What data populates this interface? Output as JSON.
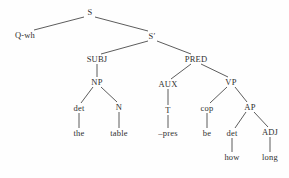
{
  "figure": {
    "type": "syntax-tree",
    "title": "",
    "background_color": "#fefefe",
    "line_color": "#4a4a4a",
    "text_color": "#2f2f2f"
  },
  "nodes": [
    {
      "id": "s",
      "label": "S",
      "kind": "category",
      "x": 90,
      "y": 12
    },
    {
      "id": "qwh",
      "label": "Q-wh",
      "kind": "category",
      "x": 25,
      "y": 35
    },
    {
      "id": "sbar",
      "label": "S′",
      "kind": "category",
      "x": 152,
      "y": 36
    },
    {
      "id": "subj",
      "label": "SUBJ",
      "kind": "category",
      "x": 97,
      "y": 59
    },
    {
      "id": "pred",
      "label": "PRED",
      "kind": "category",
      "x": 196,
      "y": 59
    },
    {
      "id": "np",
      "label": "NP",
      "kind": "category",
      "x": 97,
      "y": 82
    },
    {
      "id": "aux",
      "label": "AUX",
      "kind": "category",
      "x": 168,
      "y": 84
    },
    {
      "id": "vp",
      "label": "VP",
      "kind": "category",
      "x": 231,
      "y": 82
    },
    {
      "id": "det1",
      "label": "det",
      "kind": "category",
      "x": 79,
      "y": 108
    },
    {
      "id": "n",
      "label": "N",
      "kind": "category",
      "x": 119,
      "y": 107
    },
    {
      "id": "t",
      "label": "T",
      "kind": "category",
      "x": 168,
      "y": 110
    },
    {
      "id": "cop",
      "label": "cop",
      "kind": "category",
      "x": 207,
      "y": 108
    },
    {
      "id": "ap",
      "label": "AP",
      "kind": "category",
      "x": 250,
      "y": 107
    },
    {
      "id": "the",
      "label": "the",
      "kind": "terminal",
      "x": 79,
      "y": 133
    },
    {
      "id": "table",
      "label": "table",
      "kind": "terminal",
      "x": 119,
      "y": 133
    },
    {
      "id": "pres",
      "label": "–pres",
      "kind": "terminal",
      "x": 168,
      "y": 133
    },
    {
      "id": "be",
      "label": "be",
      "kind": "terminal",
      "x": 207,
      "y": 133
    },
    {
      "id": "det2",
      "label": "det",
      "kind": "category",
      "x": 232,
      "y": 133
    },
    {
      "id": "adj",
      "label": "ADJ",
      "kind": "category",
      "x": 270,
      "y": 132
    },
    {
      "id": "how",
      "label": "how",
      "kind": "terminal",
      "x": 232,
      "y": 157
    },
    {
      "id": "long",
      "label": "long",
      "kind": "terminal",
      "x": 270,
      "y": 157
    }
  ],
  "edges": [
    {
      "from": "s",
      "to": "qwh",
      "x1": 84,
      "y1": 17,
      "x2": 34,
      "y2": 30
    },
    {
      "from": "s",
      "to": "sbar",
      "x1": 95,
      "y1": 17,
      "x2": 148,
      "y2": 31
    },
    {
      "from": "sbar",
      "to": "subj",
      "x1": 148,
      "y1": 41,
      "x2": 101,
      "y2": 54
    },
    {
      "from": "sbar",
      "to": "pred",
      "x1": 157,
      "y1": 41,
      "x2": 191,
      "y2": 54
    },
    {
      "from": "subj",
      "to": "np",
      "x1": 97,
      "y1": 64,
      "x2": 97,
      "y2": 77
    },
    {
      "from": "pred",
      "to": "aux",
      "x1": 191,
      "y1": 64,
      "x2": 171,
      "y2": 79
    },
    {
      "from": "pred",
      "to": "vp",
      "x1": 201,
      "y1": 64,
      "x2": 228,
      "y2": 77
    },
    {
      "from": "np",
      "to": "det1",
      "x1": 93,
      "y1": 87,
      "x2": 81,
      "y2": 103
    },
    {
      "from": "np",
      "to": "n",
      "x1": 101,
      "y1": 87,
      "x2": 117,
      "y2": 102
    },
    {
      "from": "aux",
      "to": "t",
      "x1": 168,
      "y1": 89,
      "x2": 168,
      "y2": 105
    },
    {
      "from": "vp",
      "to": "cop",
      "x1": 227,
      "y1": 87,
      "x2": 210,
      "y2": 103
    },
    {
      "from": "vp",
      "to": "ap",
      "x1": 235,
      "y1": 87,
      "x2": 247,
      "y2": 102
    },
    {
      "from": "det1",
      "to": "the",
      "x1": 79,
      "y1": 113,
      "x2": 79,
      "y2": 128
    },
    {
      "from": "n",
      "to": "table",
      "x1": 119,
      "y1": 112,
      "x2": 119,
      "y2": 128
    },
    {
      "from": "t",
      "to": "pres",
      "x1": 168,
      "y1": 115,
      "x2": 168,
      "y2": 128
    },
    {
      "from": "cop",
      "to": "be",
      "x1": 207,
      "y1": 113,
      "x2": 207,
      "y2": 128
    },
    {
      "from": "ap",
      "to": "det2",
      "x1": 246,
      "y1": 112,
      "x2": 235,
      "y2": 128
    },
    {
      "from": "ap",
      "to": "adj",
      "x1": 254,
      "y1": 112,
      "x2": 268,
      "y2": 127
    },
    {
      "from": "det2",
      "to": "how",
      "x1": 232,
      "y1": 138,
      "x2": 232,
      "y2": 152
    },
    {
      "from": "adj",
      "to": "long",
      "x1": 270,
      "y1": 137,
      "x2": 270,
      "y2": 152
    }
  ]
}
